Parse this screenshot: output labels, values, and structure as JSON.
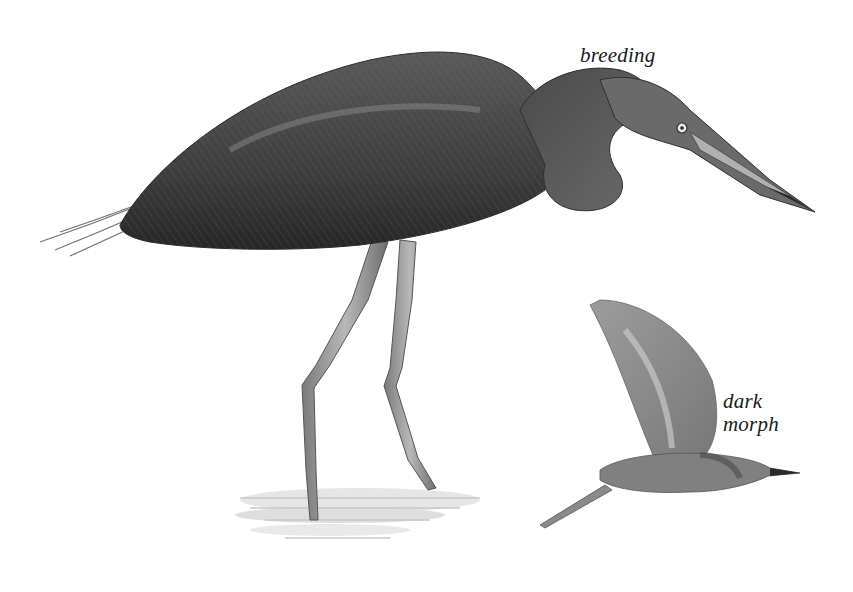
{
  "illustration": {
    "subject": "heron",
    "figures": [
      {
        "id": "standing-bird",
        "caption": "breeding"
      },
      {
        "id": "flying-bird",
        "caption_lines": [
          "dark",
          "morph"
        ]
      }
    ]
  },
  "labels": {
    "breeding": "breeding",
    "dark_line1": "dark",
    "dark_line2": "morph"
  },
  "colors": {
    "background": "#ffffff",
    "plumage_dark": "#3a3a3a",
    "plumage_mid": "#6b6b6b",
    "plumage_light": "#9a9a9a",
    "flying_bird": "#8a8a8a",
    "water": "#c8c8c8"
  }
}
